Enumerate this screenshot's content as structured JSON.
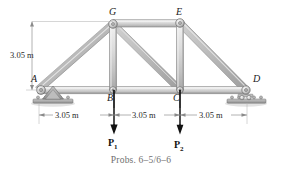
{
  "figure": {
    "caption": "Probs. 6–5/6–6",
    "type": "truss-diagram"
  },
  "joints": {
    "A": {
      "label": "A",
      "x": 38,
      "y": 90,
      "support": "pin"
    },
    "B": {
      "label": "B",
      "x": 114,
      "y": 90,
      "support": "none"
    },
    "C": {
      "label": "C",
      "x": 180,
      "y": 90,
      "support": "none"
    },
    "D": {
      "label": "D",
      "x": 246,
      "y": 90,
      "support": "roller"
    },
    "E": {
      "label": "E",
      "x": 180,
      "y": 23,
      "support": "none"
    },
    "G": {
      "label": "G",
      "x": 113,
      "y": 24,
      "support": "none"
    }
  },
  "members": [
    {
      "name": "A-B",
      "from": "A",
      "to": "B"
    },
    {
      "name": "B-C",
      "from": "B",
      "to": "C"
    },
    {
      "name": "C-D",
      "from": "C",
      "to": "D"
    },
    {
      "name": "A-G",
      "from": "A",
      "to": "G"
    },
    {
      "name": "G-E",
      "from": "G",
      "to": "E"
    },
    {
      "name": "E-D",
      "from": "E",
      "to": "D"
    },
    {
      "name": "G-B",
      "from": "G",
      "to": "B"
    },
    {
      "name": "E-C",
      "from": "E",
      "to": "C"
    },
    {
      "name": "G-C",
      "from": "G",
      "to": "C"
    }
  ],
  "loads": [
    {
      "name": "P1",
      "label": "P",
      "subscript": "1",
      "at_joint": "B",
      "direction": "down"
    },
    {
      "name": "P2",
      "label": "P",
      "subscript": "2",
      "at_joint": "C",
      "direction": "down"
    }
  ],
  "dimensions": {
    "vertical": {
      "value": "3.05 m",
      "from": "A-level",
      "to": "G-level"
    },
    "horizontal": [
      {
        "value": "3.05 m",
        "from": "A",
        "to": "B"
      },
      {
        "value": "3.05 m",
        "from": "B",
        "to": "C"
      },
      {
        "value": "3.05 m",
        "from": "C",
        "to": "D"
      }
    ]
  },
  "colors": {
    "member_fill": "#d2d2d2",
    "member_edge": "#6d6d6d",
    "support_fill": "#9a9a9a",
    "ground": "#7d7d7d",
    "dimension_line": "#808080",
    "caption": "#6f6f6f",
    "load_arrow": "#111111"
  }
}
